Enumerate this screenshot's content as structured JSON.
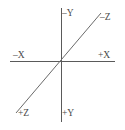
{
  "diagram": {
    "background_color": "#ffffff",
    "line_color": "#5a5a5a",
    "label_color": "#4a4a4a",
    "origin": {
      "x": 61,
      "y": 61
    },
    "axes": [
      {
        "name": "x-axis",
        "orientation": "horizontal",
        "x1": 10,
        "y1": 61,
        "x2": 115,
        "y2": 61,
        "negative_label": "–X",
        "positive_label": "+X"
      },
      {
        "name": "y-axis",
        "orientation": "vertical",
        "x1": 61,
        "y1": 8,
        "x2": 61,
        "y2": 122,
        "negative_label": "–Y",
        "positive_label": "+Y"
      },
      {
        "name": "z-axis",
        "orientation": "diagonal",
        "x1": 16,
        "y1": 113,
        "x2": 101,
        "y2": 13,
        "negative_label": "–Z",
        "positive_label": "+Z"
      }
    ],
    "labels": {
      "neg_y": "–Y",
      "neg_z": "–Z",
      "neg_x": "–X",
      "pos_x": "+X",
      "pos_z": "+Z",
      "pos_y": "+Y"
    }
  }
}
